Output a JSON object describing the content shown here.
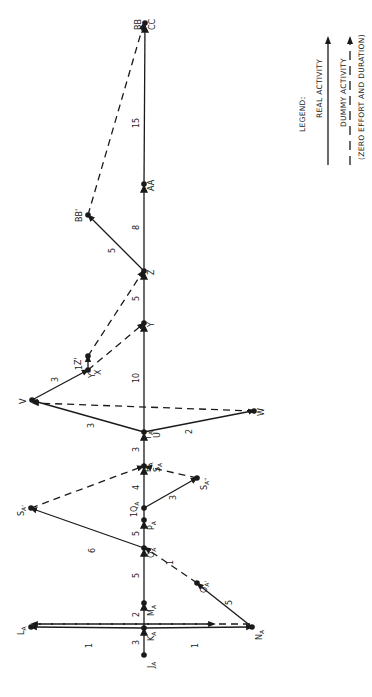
{
  "diagram": {
    "type": "activity-network (PERT, rotated 90° counter-clockwise)",
    "ink_color": "#1a1a1a",
    "background": "#ffffff",
    "nodes": [
      {
        "id": "JA",
        "label": "JA",
        "x": 144,
        "y": 655
      },
      {
        "id": "KA",
        "label": "KA",
        "x": 144,
        "y": 628
      },
      {
        "id": "LA",
        "label": "LA",
        "x": 31,
        "y": 627
      },
      {
        "id": "MA",
        "label": "MA",
        "x": 144,
        "y": 603
      },
      {
        "id": "NA",
        "label": "NA",
        "x": 252,
        "y": 627
      },
      {
        "id": "OA",
        "label": "OA",
        "x": 144,
        "y": 548
      },
      {
        "id": "OA'",
        "label": "OA'",
        "x": 197,
        "y": 583
      },
      {
        "id": "PA",
        "label": "PA",
        "x": 144,
        "y": 520
      },
      {
        "id": "QA",
        "label": "QA",
        "x": 144,
        "y": 508
      },
      {
        "id": "SA'",
        "label": "SA'",
        "x": 31,
        "y": 508
      },
      {
        "id": "SA''",
        "label": "SA''",
        "x": 197,
        "y": 478
      },
      {
        "id": "RA",
        "label": "RA SA",
        "x": 144,
        "y": 466
      },
      {
        "id": "TA",
        "label": "TA U",
        "x": 144,
        "y": 432
      },
      {
        "id": "V",
        "label": "V",
        "x": 32,
        "y": 400
      },
      {
        "id": "W",
        "label": "W",
        "x": 254,
        "y": 411
      },
      {
        "id": "Y'",
        "label": "Y' X",
        "x": 88,
        "y": 370
      },
      {
        "id": "Z'",
        "label": "Z'",
        "x": 88,
        "y": 356
      },
      {
        "id": "Y",
        "label": "Y",
        "x": 144,
        "y": 323
      },
      {
        "id": "Z",
        "label": "Z",
        "x": 144,
        "y": 271
      },
      {
        "id": "BB'",
        "label": "BB'",
        "x": 88,
        "y": 215
      },
      {
        "id": "AA",
        "label": "AA",
        "x": 144,
        "y": 184
      },
      {
        "id": "BB",
        "label": "BB CC",
        "x": 145,
        "y": 23
      }
    ],
    "activities": [
      {
        "from": "JA",
        "to": "KA",
        "kind": "real",
        "duration": "3"
      },
      {
        "from": "KA",
        "to": "LA",
        "kind": "real",
        "duration": "1"
      },
      {
        "from": "KA",
        "to": "NA",
        "kind": "real",
        "duration": "1"
      },
      {
        "from": "KA",
        "to": "MA",
        "kind": "real",
        "duration": "2"
      },
      {
        "from": "NA",
        "to": "LA",
        "kind": "dummy",
        "duration": ""
      },
      {
        "from": "LA",
        "to": "NA",
        "kind": "dummy",
        "duration": ""
      },
      {
        "from": "MA",
        "to": "OA",
        "kind": "real",
        "duration": "5"
      },
      {
        "from": "NA",
        "to": "OA'",
        "kind": "real",
        "duration": "5"
      },
      {
        "from": "OA'",
        "to": "OA",
        "kind": "dummy",
        "duration": "1"
      },
      {
        "from": "OA",
        "to": "PA",
        "kind": "real",
        "duration": "5"
      },
      {
        "from": "OA",
        "to": "SA'",
        "kind": "real",
        "duration": "6"
      },
      {
        "from": "PA",
        "to": "QA",
        "kind": "real",
        "duration": "1"
      },
      {
        "from": "QA",
        "to": "RA",
        "kind": "real",
        "duration": "4"
      },
      {
        "from": "QA",
        "to": "SA''",
        "kind": "real",
        "duration": "3"
      },
      {
        "from": "SA'",
        "to": "RA",
        "kind": "dummy",
        "duration": ""
      },
      {
        "from": "SA''",
        "to": "RA",
        "kind": "dummy",
        "duration": ""
      },
      {
        "from": "RA",
        "to": "TA",
        "kind": "real",
        "duration": "3"
      },
      {
        "from": "TA",
        "to": "V",
        "kind": "real",
        "duration": "3"
      },
      {
        "from": "TA",
        "to": "W",
        "kind": "real",
        "duration": "2"
      },
      {
        "from": "W",
        "to": "V",
        "kind": "dummy",
        "duration": ""
      },
      {
        "from": "TA",
        "to": "Y",
        "kind": "real",
        "duration": "10"
      },
      {
        "from": "V",
        "to": "Y'",
        "kind": "real",
        "duration": "3"
      },
      {
        "from": "Y'",
        "to": "Z'",
        "kind": "real",
        "duration": "1"
      },
      {
        "from": "Y'",
        "to": "Y",
        "kind": "dummy",
        "duration": ""
      },
      {
        "from": "Z'",
        "to": "Z",
        "kind": "dummy",
        "duration": ""
      },
      {
        "from": "Y",
        "to": "Z",
        "kind": "real",
        "duration": "5"
      },
      {
        "from": "Z",
        "to": "BB'",
        "kind": "real",
        "duration": "5"
      },
      {
        "from": "Z",
        "to": "AA",
        "kind": "real",
        "duration": "8"
      },
      {
        "from": "AA",
        "to": "BB",
        "kind": "real",
        "duration": "15"
      },
      {
        "from": "BB'",
        "to": "BB",
        "kind": "dummy",
        "duration": ""
      }
    ],
    "text": {
      "JA": "J",
      "JA_sub": "A",
      "KA": "K",
      "KA_sub": "A",
      "LA": "L",
      "LA_sub": "A",
      "MA": "M",
      "MA_sub": "A",
      "NA": "N",
      "NA_sub": "A",
      "OA": "O",
      "OA_sub": "A",
      "OAp": "O",
      "OAp_sub": "A'",
      "PA": "P",
      "PA_sub": "A",
      "QA": "Q",
      "QA_sub": "A",
      "RA": "R",
      "RA_sub": "A",
      "SA": "S",
      "SA_sub": "A",
      "SAp": "S",
      "SAp_sub": "A'",
      "SApp": "S",
      "SApp_sub": "A''",
      "TA": "T",
      "TA_sub": "A",
      "U": "U",
      "V": "V",
      "W": "W",
      "X": "X",
      "Yp": "Y'",
      "Zp": "Z'",
      "Y": "Y",
      "Z": "Z",
      "AA": "AA",
      "BBp": "BB'",
      "BB": "BB",
      "CC": "CC"
    },
    "durations": {
      "JA_KA": "3",
      "KA_LA": "1",
      "KA_NA": "1",
      "KA_MA": "2",
      "MA_OA": "5",
      "NA_OAp": "5",
      "OAp_OA": "1",
      "OA_PA": "5",
      "OA_SAp": "6",
      "PA_QA": "1",
      "QA_RA": "4",
      "QA_SApp": "3",
      "RA_TA": "3",
      "TA_V": "3",
      "TA_W": "2",
      "TA_Y": "10",
      "V_Yp": "3",
      "Yp_Zp": "1",
      "Y_Z": "5",
      "Z_BBp": "5",
      "Z_AA": "8",
      "AA_BB": "15"
    }
  },
  "legend": {
    "title": "LEGEND:",
    "real_label": "REAL ACTIVITY",
    "dummy_label": "DUMMY ACTIVITY",
    "dummy_note": "(ZERO EFFORT AND DURATION)"
  }
}
